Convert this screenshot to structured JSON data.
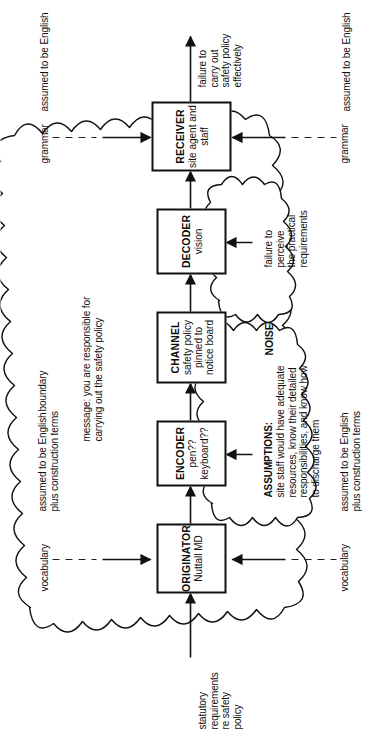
{
  "diagram": {
    "type": "communication-model",
    "boundary_label": "boundary",
    "inputs": {
      "origin_input": "statutory\nrequirements\nre safety\npolicy",
      "receiver_output": "failure to\ncarry out\nsafety policy\neffectively"
    },
    "boxes": [
      {
        "id": "originator",
        "title": "ORIGINATOR",
        "subtitle": "Nuttall\nMD"
      },
      {
        "id": "encoder",
        "title": "ENCODER",
        "subtitle": "pen??\nkeyboard??"
      },
      {
        "id": "channel",
        "title": "CHANNEL",
        "subtitle": "safety policy\npinned to\nnotice board"
      },
      {
        "id": "decoder",
        "title": "DECODER",
        "subtitle": "vision"
      },
      {
        "id": "receiver",
        "title": "RECEIVER",
        "subtitle": "site agent\nand staff"
      }
    ],
    "clouds": [
      {
        "id": "assumptions-noise",
        "heading": "ASSUMPTIONS:",
        "body": "site staff would have adequate\nresources, know their detailed\nresponsibilities, and know how\nto discharge them",
        "tag": "NOISE"
      },
      {
        "id": "perception-noise",
        "heading": "",
        "body": "failure to\nperceive\nthe practical\nrequirements",
        "tag": ""
      }
    ],
    "side_labels": {
      "vocabulary_top": "vocabulary",
      "vocabulary_bottom": "vocabulary",
      "grammar_top": "grammar",
      "grammar_bottom": "grammar",
      "english_left_top": "assumed to be English\nplus construction terms",
      "english_left_bottom": "assumed to be English\nplus construction terms",
      "english_right_top": "assumed to be English",
      "english_right_bottom": "assumed to be English"
    },
    "message_label": "message: you are responsible for\ncarrying out the safety policy",
    "colors": {
      "ink": "#111111",
      "paper": "#ffffff",
      "dashed": "#222222"
    }
  }
}
